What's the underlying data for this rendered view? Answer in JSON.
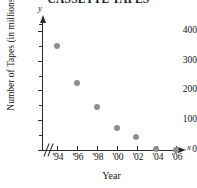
{
  "chart_data": {
    "type": "scatter",
    "title": "CASSETTE TAPES",
    "xlabel": "Year",
    "ylabel": "Number of Tapes (in millions)",
    "x_axis_letter": "y",
    "y_axis_letter": "x",
    "categories": [
      "'94",
      "'96",
      "'98",
      "'00",
      "'02",
      "'04",
      "'06"
    ],
    "x": [
      1994,
      1996,
      1998,
      2000,
      2002,
      2004,
      2006
    ],
    "values": [
      350,
      225,
      145,
      74,
      44,
      3,
      1
    ],
    "ylim": [
      0,
      450
    ],
    "xlim": [
      1993,
      2007
    ],
    "y_ticks": [
      0,
      100,
      200,
      300,
      400
    ],
    "y_minor_ticks": [
      50,
      150,
      250,
      350,
      450
    ],
    "y_tick_labels": [
      "0",
      "100",
      "200",
      "300",
      "400"
    ],
    "x_tick_labels": [
      "'94",
      "'96",
      "'98",
      "'00",
      "'02",
      "'04",
      "'06"
    ],
    "grid": false,
    "legend": false,
    "axis_break_x": true,
    "marker_color": "#8e8e8e",
    "axis_color": "#2b2b2b",
    "points": [
      {
        "label": "'94",
        "value": 350
      },
      {
        "label": "'96",
        "value": 225
      },
      {
        "label": "'98",
        "value": 145
      },
      {
        "label": "'00",
        "value": 74
      },
      {
        "label": "'02",
        "value": 44
      },
      {
        "label": "'04",
        "value": 3
      },
      {
        "label": "'06",
        "value": 1
      }
    ]
  }
}
